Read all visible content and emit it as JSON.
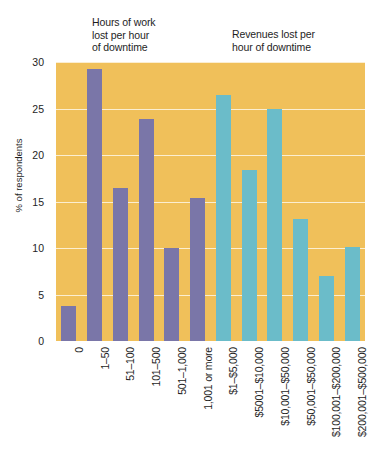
{
  "captions": {
    "hours": "Hours of work\nlost per hour\nof downtime",
    "revenues": "Revenues lost per\nhour of downtime"
  },
  "colors": {
    "plot_background": "#f0c05a",
    "series_hours": "#7a76a8",
    "series_revenues": "#6bbcc9",
    "gridline": "#ffffff",
    "text": "#1e1e1e"
  },
  "chart_data": {
    "type": "bar",
    "title": "",
    "xlabel": "",
    "ylabel": "% of respondents",
    "ylim": [
      0,
      30
    ],
    "yticks": [
      0,
      5,
      10,
      15,
      20,
      25,
      30
    ],
    "ytick_labels": [
      "0",
      "5",
      "10",
      "15",
      "20",
      "25",
      "30"
    ],
    "grid": true,
    "legend": "none",
    "groups": [
      {
        "name": "Hours of work lost per hour of downtime",
        "color": "#7a76a8",
        "categories": [
          "0",
          "1–50",
          "51–100",
          "101–500",
          "501–1,000",
          "1,001 or more"
        ],
        "values": [
          3.8,
          29.3,
          16.4,
          23.9,
          10.0,
          15.4
        ]
      },
      {
        "name": "Revenues lost per hour of downtime",
        "color": "#6bbcc9",
        "categories": [
          "$1–$5,000",
          "$5001–$10,000",
          "$10,001–$50,000",
          "$50,001–$50,000",
          "$100,001–$200,000",
          "$200,001–$500,000"
        ],
        "values": [
          26.4,
          18.4,
          24.9,
          13.1,
          7.0,
          10.1
        ]
      }
    ]
  }
}
